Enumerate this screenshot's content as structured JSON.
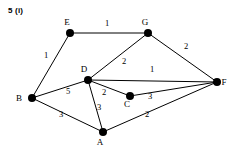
{
  "figure": {
    "label": "5 (i)",
    "width": 236,
    "height": 157,
    "background_color": "#ffffff",
    "stroke_color": "#000000"
  },
  "graph_data": {
    "type": "weighted-undirected-graph",
    "nodes": [
      {
        "id": "E",
        "label": "E",
        "x": 70,
        "y": 33,
        "label_dx": -3,
        "label_dy": -8
      },
      {
        "id": "G",
        "label": "G",
        "x": 148,
        "y": 33,
        "label_dx": -3,
        "label_dy": -8
      },
      {
        "id": "F",
        "label": "F",
        "x": 217,
        "y": 82,
        "label_dx": 7,
        "label_dy": 3
      },
      {
        "id": "B",
        "label": "B",
        "x": 32,
        "y": 98,
        "label_dx": -13,
        "label_dy": 3
      },
      {
        "id": "D",
        "label": "D",
        "x": 88,
        "y": 80,
        "label_dx": -4,
        "label_dy": -8
      },
      {
        "id": "C",
        "label": "C",
        "x": 130,
        "y": 96,
        "label_dx": -3,
        "label_dy": 11
      },
      {
        "id": "A",
        "label": "A",
        "x": 103,
        "y": 132,
        "label_dx": -3,
        "label_dy": 13
      }
    ],
    "edges": [
      {
        "from": "B",
        "to": "E",
        "weight": "1",
        "wx": 46,
        "wy": 58
      },
      {
        "from": "E",
        "to": "G",
        "weight": "1",
        "wx": 107,
        "wy": 26
      },
      {
        "from": "G",
        "to": "D",
        "weight": "2",
        "wx": 124,
        "wy": 64
      },
      {
        "from": "G",
        "to": "F",
        "weight": "2",
        "wx": 186,
        "wy": 49
      },
      {
        "from": "D",
        "to": "F",
        "weight": "1",
        "wx": 152,
        "wy": 72
      },
      {
        "from": "B",
        "to": "D",
        "weight": "5",
        "wx": 68,
        "wy": 94
      },
      {
        "from": "D",
        "to": "C",
        "weight": "2",
        "wx": 104,
        "wy": 95
      },
      {
        "from": "D",
        "to": "A",
        "weight": "3",
        "wx": 99,
        "wy": 110
      },
      {
        "from": "C",
        "to": "F",
        "weight": "3",
        "wx": 150,
        "wy": 99
      },
      {
        "from": "A",
        "to": "F",
        "weight": "2",
        "wx": 147,
        "wy": 117
      },
      {
        "from": "B",
        "to": "A",
        "weight": "3",
        "wx": 61,
        "wy": 117
      }
    ]
  }
}
